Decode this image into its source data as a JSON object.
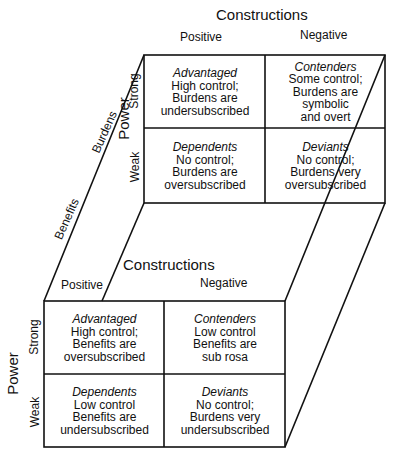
{
  "back_grid": {
    "title": "Constructions",
    "columns": [
      "Positive",
      "Negative"
    ],
    "axis_label": "Power",
    "rows": [
      "Strong",
      "Weak"
    ],
    "cells": [
      {
        "name": "Advantaged",
        "l1": "High control;",
        "l2": "Burdens are",
        "l3": "undersubscribed",
        "l4": ""
      },
      {
        "name": "Contenders",
        "l1": "Some control;",
        "l2": "Burdens are",
        "l3": "symbolic",
        "l4": "and overt"
      },
      {
        "name": "Dependents",
        "l1": "No control;",
        "l2": "Burdens are",
        "l3": "oversubscribed",
        "l4": ""
      },
      {
        "name": "Deviants",
        "l1": "No control;",
        "l2": "Burdens very",
        "l3": "oversubscribed",
        "l4": ""
      }
    ]
  },
  "front_grid": {
    "title": "Constructions",
    "columns": [
      "Positive",
      "Negative"
    ],
    "axis_label": "Power",
    "rows": [
      "Strong",
      "Weak"
    ],
    "cells": [
      {
        "name": "Advantaged",
        "l1": "High control;",
        "l2": "Benefits are",
        "l3": "oversubscribed"
      },
      {
        "name": "Contenders",
        "l1": "Low control",
        "l2": "Benefits are",
        "l3": "sub rosa"
      },
      {
        "name": "Dependents",
        "l1": "Low control",
        "l2": "Benefits are",
        "l3": "undersubscribed"
      },
      {
        "name": "Deviants",
        "l1": "No control;",
        "l2": "Burdens very",
        "l3": "undersubscribed"
      }
    ]
  },
  "depth_axis": {
    "far": "Burdens",
    "near": "Benefits"
  }
}
